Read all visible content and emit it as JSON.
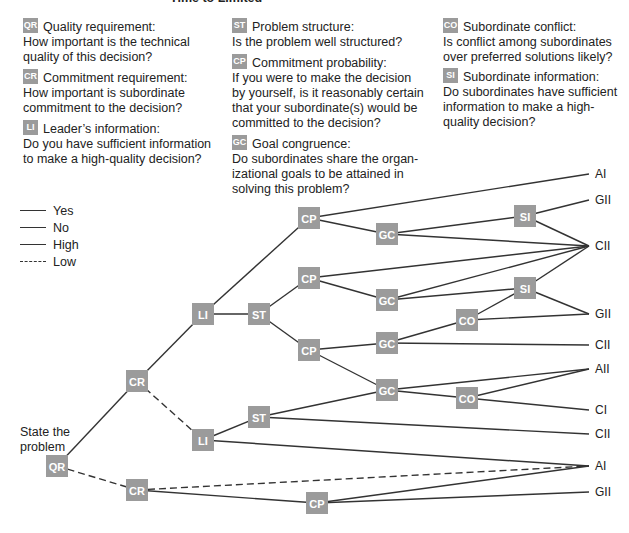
{
  "header": {
    "cut_title": "Time to Limited"
  },
  "definitions": [
    {
      "code": "QR",
      "title": "Quality requirement:",
      "lines": [
        "How important is the technical",
        "quality of this decision?"
      ]
    },
    {
      "code": "CR",
      "title": "Commitment requirement:",
      "lines": [
        "How important is subordinate",
        "commitment to the decision?"
      ]
    },
    {
      "code": "LI",
      "title": "Leader’s information:",
      "lines": [
        "Do you have sufficient information",
        "to make a high-quality decision?"
      ]
    },
    {
      "code": "ST",
      "title": "Problem structure:",
      "lines": [
        "Is the problem well structured?"
      ]
    },
    {
      "code": "CP",
      "title": "Commitment probability:",
      "lines": [
        "If you were to make the decision",
        "by yourself, is it reasonably certain",
        "that your subordinate(s) would be",
        "committed to the decision?"
      ]
    },
    {
      "code": "GC",
      "title": "Goal congruence:",
      "lines": [
        "Do subordinates share the organ-",
        "izational goals to be attained in",
        "solving this problem?"
      ]
    },
    {
      "code": "CO",
      "title": "Subordinate conflict:",
      "lines": [
        "Is conflict among subordinates",
        "over preferred solutions likely?"
      ]
    },
    {
      "code": "SI",
      "title": "Subordinate information:",
      "lines": [
        "Do subordinates have sufficient",
        "information to make a high-",
        "quality decision?"
      ]
    }
  ],
  "legend": [
    {
      "label": "Yes",
      "style": "solid"
    },
    {
      "label": "No",
      "style": "solid"
    },
    {
      "label": "High",
      "style": "solid"
    },
    {
      "label": "Low",
      "style": "dashed"
    }
  ],
  "start_label": [
    "State the",
    "problem"
  ],
  "tree": {
    "nodes": [
      {
        "id": "qr",
        "label": "QR"
      },
      {
        "id": "cr1",
        "label": "CR"
      },
      {
        "id": "cr2",
        "label": "CR"
      },
      {
        "id": "li1",
        "label": "LI"
      },
      {
        "id": "li2",
        "label": "LI"
      },
      {
        "id": "st1",
        "label": "ST"
      },
      {
        "id": "st2",
        "label": "ST"
      },
      {
        "id": "cp1",
        "label": "CP"
      },
      {
        "id": "cp2",
        "label": "CP"
      },
      {
        "id": "cp3",
        "label": "CP"
      },
      {
        "id": "cp4",
        "label": "CP"
      },
      {
        "id": "gc1",
        "label": "GC"
      },
      {
        "id": "gc2",
        "label": "GC"
      },
      {
        "id": "gc3",
        "label": "GC"
      },
      {
        "id": "gc4",
        "label": "GC"
      },
      {
        "id": "si1",
        "label": "SI"
      },
      {
        "id": "si2",
        "label": "SI"
      },
      {
        "id": "co1",
        "label": "CO"
      },
      {
        "id": "co2",
        "label": "CO"
      }
    ],
    "outcomes": [
      {
        "id": "o1",
        "label": "AI"
      },
      {
        "id": "o2",
        "label": "GII"
      },
      {
        "id": "o3",
        "label": "CII"
      },
      {
        "id": "o4",
        "label": "GII"
      },
      {
        "id": "o5",
        "label": "CII"
      },
      {
        "id": "o6",
        "label": "AII"
      },
      {
        "id": "o7",
        "label": "CI"
      },
      {
        "id": "o8",
        "label": "CII"
      },
      {
        "id": "o9",
        "label": "AI"
      },
      {
        "id": "o10",
        "label": "GII"
      }
    ],
    "edges": [
      [
        "qr",
        "cr1",
        "solid"
      ],
      [
        "qr",
        "cr2",
        "dashed"
      ],
      [
        "cr1",
        "li1",
        "solid"
      ],
      [
        "cr1",
        "li2",
        "dashed"
      ],
      [
        "li1",
        "cp1",
        "solid"
      ],
      [
        "li1",
        "st1",
        "solid"
      ],
      [
        "st1",
        "cp2",
        "solid"
      ],
      [
        "st1",
        "cp3",
        "solid"
      ],
      [
        "cp1",
        "o1",
        "solid"
      ],
      [
        "cp1",
        "gc1",
        "solid"
      ],
      [
        "gc1",
        "si1",
        "solid"
      ],
      [
        "gc1",
        "o3",
        "solid"
      ],
      [
        "si1",
        "o2",
        "solid"
      ],
      [
        "si1",
        "o3",
        "solid"
      ],
      [
        "cp2",
        "o3",
        "solid"
      ],
      [
        "cp2",
        "gc2",
        "solid"
      ],
      [
        "gc2",
        "o3",
        "solid"
      ],
      [
        "gc2",
        "si2",
        "solid"
      ],
      [
        "si2",
        "o3",
        "solid"
      ],
      [
        "si2",
        "o4",
        "solid"
      ],
      [
        "cp3",
        "gc3",
        "solid"
      ],
      [
        "cp3",
        "gc4",
        "solid"
      ],
      [
        "gc3",
        "co1",
        "solid"
      ],
      [
        "gc3",
        "o5",
        "solid"
      ],
      [
        "co1",
        "si2",
        "solid"
      ],
      [
        "co1",
        "o4",
        "solid"
      ],
      [
        "gc4",
        "o6",
        "solid"
      ],
      [
        "gc4",
        "co2",
        "solid"
      ],
      [
        "co2",
        "o6",
        "solid"
      ],
      [
        "co2",
        "o7",
        "solid"
      ],
      [
        "li2",
        "st2",
        "solid"
      ],
      [
        "li2",
        "o9",
        "solid"
      ],
      [
        "st2",
        "gc4",
        "solid"
      ],
      [
        "st2",
        "o8",
        "solid"
      ],
      [
        "cr2",
        "o9",
        "dashed"
      ],
      [
        "cr2",
        "cp4",
        "solid"
      ],
      [
        "cp4",
        "o9",
        "solid"
      ],
      [
        "cp4",
        "o10",
        "solid"
      ]
    ]
  }
}
